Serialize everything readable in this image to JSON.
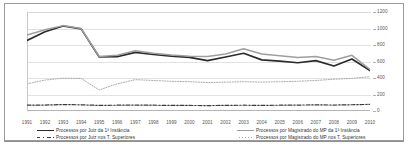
{
  "chart_data": {
    "type": "line",
    "title": "",
    "xlabel": "",
    "ylabel": "",
    "ylim": [
      0,
      1200
    ],
    "yticks": [
      0,
      200,
      400,
      600,
      800,
      1000,
      1200
    ],
    "grid": true,
    "legend_position": "bottom",
    "categories": [
      "1991",
      "1992",
      "1993",
      "1994",
      "1995",
      "1996",
      "1997",
      "1998",
      "1999",
      "2000",
      "2001",
      "2002",
      "2003",
      "2004",
      "2005",
      "2006",
      "2007",
      "2008",
      "2009",
      "2010"
    ],
    "series": [
      {
        "name": "Processos por Juiz da 1ª Instância",
        "style": "solid",
        "color": "#2b2b2b",
        "values": [
          855,
          960,
          1030,
          995,
          655,
          660,
          710,
          685,
          665,
          650,
          610,
          655,
          700,
          620,
          605,
          585,
          610,
          545,
          630,
          490
        ]
      },
      {
        "name": "Processos por Magistrado do MP da 1ª Instância",
        "style": "solid",
        "color": "#9e9e9e",
        "values": [
          920,
          985,
          1035,
          1000,
          660,
          675,
          730,
          700,
          680,
          665,
          660,
          690,
          755,
          690,
          670,
          650,
          660,
          615,
          675,
          505
        ]
      },
      {
        "name": "Processos por Juiz nos T. Superiores",
        "style": "dash-dot",
        "color": "#3a3a3a",
        "values": [
          70,
          72,
          78,
          75,
          68,
          70,
          72,
          70,
          68,
          67,
          66,
          68,
          70,
          68,
          70,
          72,
          74,
          72,
          76,
          80
        ]
      },
      {
        "name": "Processos por Magistrado do MP nos T. Superiores",
        "style": "dotted",
        "color": "#aaaaaa",
        "values": [
          330,
          375,
          398,
          395,
          255,
          330,
          380,
          370,
          360,
          355,
          345,
          350,
          355,
          350,
          355,
          360,
          370,
          385,
          395,
          415
        ]
      }
    ]
  },
  "legend": {
    "items": [
      {
        "label": "Processos por Juiz da 1ª Instância",
        "swatch": "solid-dark"
      },
      {
        "label": "Processos por Magistrado do MP da 1ª Instância",
        "swatch": "solid-light"
      },
      {
        "label": "Processos por Juiz nos T. Superiores",
        "swatch": "dashdot"
      },
      {
        "label": "Processos por Magistrado do MP nos T. Superiores",
        "swatch": "dot"
      }
    ]
  }
}
